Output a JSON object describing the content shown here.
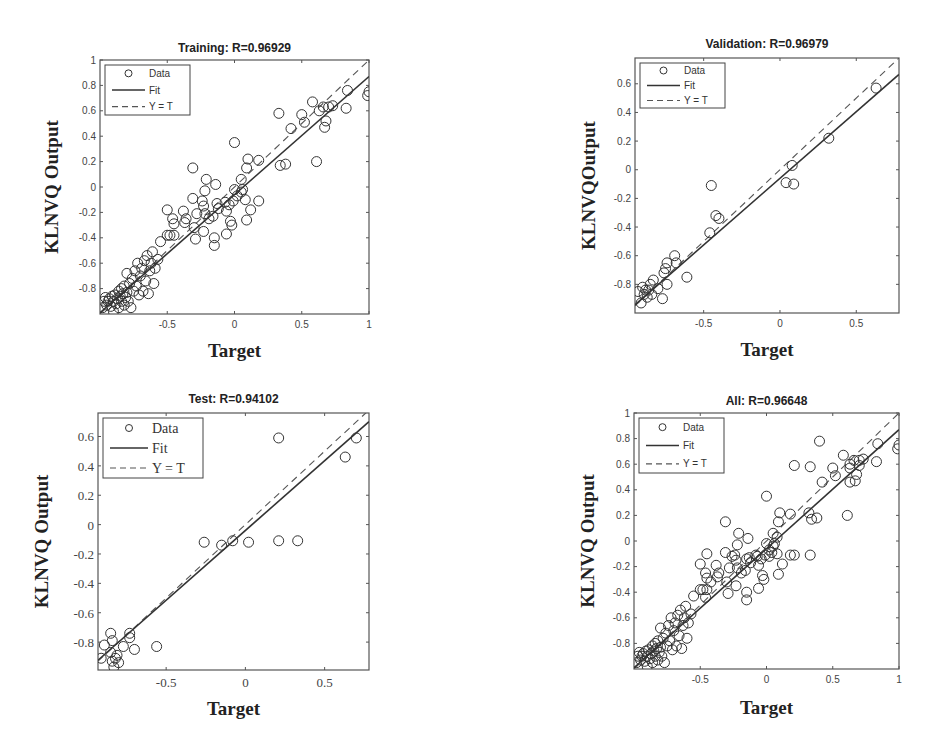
{
  "chart_data": [
    {
      "type": "scatter",
      "id": "training",
      "title": "Training: R=0.96929",
      "xlabel": "Target",
      "ylabel": "KLNVQ Output",
      "xlim": [
        -1,
        1
      ],
      "ylim": [
        -1,
        1
      ],
      "xticks": [
        -0.5,
        0,
        0.5,
        1
      ],
      "xtick_labels": [
        "-0.5",
        "0",
        "0.5",
        "1"
      ],
      "yticks": [
        -0.8,
        -0.6,
        -0.4,
        -0.2,
        0,
        0.2,
        0.4,
        0.6,
        0.8,
        1
      ],
      "ytick_labels": [
        "-0.8",
        "-0.6",
        "-0.4",
        "-0.2",
        "0",
        "0.2",
        "0.4",
        "0.6",
        "0.8",
        "1"
      ],
      "legend": [
        "Data",
        "Fit",
        "Y = T"
      ],
      "legend_position": "upper left",
      "grid": false,
      "fit": {
        "slope": 0.93,
        "intercept": -0.06
      },
      "points": [
        [
          -0.98,
          -0.95
        ],
        [
          -0.97,
          -0.9
        ],
        [
          -0.96,
          -0.87
        ],
        [
          -0.95,
          -0.93
        ],
        [
          -0.94,
          -0.9
        ],
        [
          -0.93,
          -0.88
        ],
        [
          -0.92,
          -0.94
        ],
        [
          -0.91,
          -0.86
        ],
        [
          -0.9,
          -0.9
        ],
        [
          -0.9,
          -0.98
        ],
        [
          -0.89,
          -0.85
        ],
        [
          -0.88,
          -0.92
        ],
        [
          -0.87,
          -0.88
        ],
        [
          -0.86,
          -0.82
        ],
        [
          -0.86,
          -0.95
        ],
        [
          -0.85,
          -0.86
        ],
        [
          -0.84,
          -0.9
        ],
        [
          -0.84,
          -0.8
        ],
        [
          -0.83,
          -0.84
        ],
        [
          -0.82,
          -0.93
        ],
        [
          -0.82,
          -0.78
        ],
        [
          -0.81,
          -0.87
        ],
        [
          -0.8,
          -0.83
        ],
        [
          -0.8,
          -0.68
        ],
        [
          -0.79,
          -0.9
        ],
        [
          -0.78,
          -0.76
        ],
        [
          -0.77,
          -0.95
        ],
        [
          -0.76,
          -0.72
        ],
        [
          -0.75,
          -0.82
        ],
        [
          -0.74,
          -0.66
        ],
        [
          -0.73,
          -0.78
        ],
        [
          -0.72,
          -0.6
        ],
        [
          -0.71,
          -0.85
        ],
        [
          -0.7,
          -0.7
        ],
        [
          -0.69,
          -0.64
        ],
        [
          -0.68,
          -0.82
        ],
        [
          -0.67,
          -0.58
        ],
        [
          -0.66,
          -0.74
        ],
        [
          -0.65,
          -0.54
        ],
        [
          -0.64,
          -0.84
        ],
        [
          -0.63,
          -0.66
        ],
        [
          -0.62,
          -0.6
        ],
        [
          -0.61,
          -0.51
        ],
        [
          -0.6,
          -0.76
        ],
        [
          -0.59,
          -0.64
        ],
        [
          -0.57,
          -0.57
        ],
        [
          -0.55,
          -0.43
        ],
        [
          -0.5,
          -0.18
        ],
        [
          -0.5,
          -0.38
        ],
        [
          -0.48,
          -0.38
        ],
        [
          -0.46,
          -0.25
        ],
        [
          -0.45,
          -0.29
        ],
        [
          -0.45,
          -0.38
        ],
        [
          -0.38,
          -0.19
        ],
        [
          -0.37,
          -0.28
        ],
        [
          -0.36,
          -0.25
        ],
        [
          -0.31,
          0.15
        ],
        [
          -0.31,
          -0.09
        ],
        [
          -0.3,
          -0.32
        ],
        [
          -0.29,
          -0.41
        ],
        [
          -0.28,
          -0.21
        ],
        [
          -0.24,
          -0.11
        ],
        [
          -0.23,
          -0.15
        ],
        [
          -0.23,
          -0.35
        ],
        [
          -0.22,
          -0.03
        ],
        [
          -0.22,
          -0.21
        ],
        [
          -0.21,
          0.06
        ],
        [
          -0.19,
          -0.25
        ],
        [
          -0.16,
          -0.23
        ],
        [
          -0.15,
          -0.4
        ],
        [
          -0.15,
          -0.46
        ],
        [
          -0.14,
          0.02
        ],
        [
          -0.13,
          -0.13
        ],
        [
          -0.12,
          -0.17
        ],
        [
          -0.07,
          -0.12
        ],
        [
          -0.06,
          -0.19
        ],
        [
          -0.06,
          -0.37
        ],
        [
          -0.04,
          -0.14
        ],
        [
          -0.03,
          -0.27
        ],
        [
          -0.02,
          -0.3
        ],
        [
          -0.01,
          -0.11
        ],
        [
          0.0,
          0.35
        ],
        [
          0.0,
          -0.02
        ],
        [
          0.02,
          -0.07
        ],
        [
          0.05,
          0.06
        ],
        [
          0.05,
          -0.04
        ],
        [
          0.06,
          -0.02
        ],
        [
          0.08,
          -0.1
        ],
        [
          0.09,
          0.15
        ],
        [
          0.09,
          -0.26
        ],
        [
          0.1,
          0.22
        ],
        [
          0.12,
          -0.18
        ],
        [
          0.18,
          0.21
        ],
        [
          0.18,
          -0.11
        ],
        [
          0.33,
          0.58
        ],
        [
          0.34,
          0.17
        ],
        [
          0.38,
          0.18
        ],
        [
          0.42,
          0.46
        ],
        [
          0.5,
          0.57
        ],
        [
          0.52,
          0.51
        ],
        [
          0.58,
          0.67
        ],
        [
          0.61,
          0.2
        ],
        [
          0.63,
          0.6
        ],
        [
          0.66,
          0.63
        ],
        [
          0.67,
          0.47
        ],
        [
          0.68,
          0.52
        ],
        [
          0.7,
          0.63
        ],
        [
          0.73,
          0.64
        ],
        [
          0.83,
          0.62
        ],
        [
          0.84,
          0.76
        ],
        [
          0.99,
          0.72
        ],
        [
          1.0,
          0.75
        ]
      ]
    },
    {
      "type": "scatter",
      "id": "validation",
      "title": "Validation: R=0.96979",
      "xlabel": "Target",
      "ylabel": "KLNVQOutput",
      "xlim": [
        -0.95,
        0.78
      ],
      "ylim": [
        -1.0,
        0.78
      ],
      "xticks": [
        -0.5,
        0,
        0.5
      ],
      "xtick_labels": [
        "-0.5",
        "0",
        "0.5"
      ],
      "yticks": [
        -0.8,
        -0.6,
        -0.4,
        -0.2,
        0,
        0.2,
        0.4,
        0.6
      ],
      "ytick_labels": [
        "-0.8",
        "-0.6",
        "-0.4",
        "-0.2",
        "0",
        "0.2",
        "0.4",
        "0.6"
      ],
      "legend": [
        "Data",
        "Fit",
        "Y = T"
      ],
      "legend_position": "upper left",
      "grid": false,
      "fit": {
        "slope": 0.93,
        "intercept": -0.06
      },
      "points": [
        [
          -0.93,
          -0.85
        ],
        [
          -0.91,
          -0.93
        ],
        [
          -0.9,
          -0.82
        ],
        [
          -0.89,
          -0.87
        ],
        [
          -0.88,
          -0.84
        ],
        [
          -0.87,
          -0.89
        ],
        [
          -0.86,
          -0.84
        ],
        [
          -0.85,
          -0.8
        ],
        [
          -0.84,
          -0.87
        ],
        [
          -0.83,
          -0.77
        ],
        [
          -0.8,
          -0.83
        ],
        [
          -0.77,
          -0.9
        ],
        [
          -0.76,
          -0.72
        ],
        [
          -0.75,
          -0.69
        ],
        [
          -0.74,
          -0.65
        ],
        [
          -0.74,
          -0.8
        ],
        [
          -0.69,
          -0.6
        ],
        [
          -0.68,
          -0.65
        ],
        [
          -0.61,
          -0.75
        ],
        [
          -0.46,
          -0.44
        ],
        [
          -0.45,
          -0.11
        ],
        [
          -0.42,
          -0.32
        ],
        [
          -0.4,
          -0.34
        ],
        [
          0.04,
          -0.09
        ],
        [
          0.08,
          0.03
        ],
        [
          0.09,
          -0.1
        ],
        [
          0.32,
          0.22
        ],
        [
          0.63,
          0.57
        ]
      ]
    },
    {
      "type": "scatter",
      "id": "test",
      "title": "Test: R=0.94102",
      "xlabel": "Target",
      "ylabel": "KLNVQ Output",
      "xlim": [
        -0.93,
        0.78
      ],
      "ylim": [
        -0.99,
        0.76
      ],
      "xticks": [
        -0.5,
        0,
        0.5
      ],
      "xtick_labels": [
        "-0.5",
        "0",
        "0.5"
      ],
      "yticks": [
        -0.8,
        -0.6,
        -0.4,
        -0.2,
        0,
        0.2,
        0.4,
        0.6
      ],
      "ytick_labels": [
        "-0.8",
        "-0.6",
        "-0.4",
        "-0.2",
        "0",
        "0.2",
        "0.4",
        "0.6"
      ],
      "legend": [
        "Data",
        "Fit",
        "Y = T"
      ],
      "legend_position": "upper left",
      "grid": false,
      "fit": {
        "slope": 0.95,
        "intercept": -0.04
      },
      "points": [
        [
          -0.91,
          -0.91
        ],
        [
          -0.89,
          -0.82
        ],
        [
          -0.85,
          -0.74
        ],
        [
          -0.85,
          -0.87
        ],
        [
          -0.84,
          -0.93
        ],
        [
          -0.84,
          -0.79
        ],
        [
          -0.83,
          -0.97
        ],
        [
          -0.82,
          -0.91
        ],
        [
          -0.81,
          -0.89
        ],
        [
          -0.8,
          -0.94
        ],
        [
          -0.77,
          -0.83
        ],
        [
          -0.73,
          -0.74
        ],
        [
          -0.73,
          -0.77
        ],
        [
          -0.7,
          -0.85
        ],
        [
          -0.56,
          -0.83
        ],
        [
          -0.26,
          -0.12
        ],
        [
          -0.15,
          -0.14
        ],
        [
          -0.08,
          -0.11
        ],
        [
          0.02,
          -0.12
        ],
        [
          0.21,
          0.59
        ],
        [
          0.21,
          -0.11
        ],
        [
          0.33,
          -0.11
        ],
        [
          0.63,
          0.46
        ],
        [
          0.7,
          0.59
        ]
      ]
    },
    {
      "type": "scatter",
      "id": "all",
      "title": "All: R=0.96648",
      "xlabel": "Target",
      "ylabel": "KLNVQ Output",
      "xlim": [
        -1,
        1
      ],
      "ylim": [
        -1,
        1
      ],
      "xticks": [
        -0.5,
        0,
        0.5,
        1
      ],
      "xtick_labels": [
        "-0.5",
        "0",
        "0.5",
        "1"
      ],
      "yticks": [
        -0.8,
        -0.6,
        -0.4,
        -0.2,
        0,
        0.2,
        0.4,
        0.6,
        0.8,
        1
      ],
      "ytick_labels": [
        "-0.8",
        "-0.6",
        "-0.4",
        "-0.2",
        "0",
        "0.2",
        "0.4",
        "0.6",
        "0.8",
        "1"
      ],
      "legend": [
        "Data",
        "Fit",
        "Y = T"
      ],
      "legend_position": "upper left",
      "grid": false,
      "fit": {
        "slope": 0.93,
        "intercept": -0.06
      },
      "points": [
        [
          -0.98,
          -0.95
        ],
        [
          -0.97,
          -0.9
        ],
        [
          -0.96,
          -0.87
        ],
        [
          -0.95,
          -0.93
        ],
        [
          -0.94,
          -0.9
        ],
        [
          -0.93,
          -0.88
        ],
        [
          -0.92,
          -0.94
        ],
        [
          -0.91,
          -0.86
        ],
        [
          -0.9,
          -0.9
        ],
        [
          -0.9,
          -0.98
        ],
        [
          -0.89,
          -0.85
        ],
        [
          -0.88,
          -0.92
        ],
        [
          -0.87,
          -0.88
        ],
        [
          -0.86,
          -0.82
        ],
        [
          -0.86,
          -0.95
        ],
        [
          -0.85,
          -0.86
        ],
        [
          -0.84,
          -0.9
        ],
        [
          -0.84,
          -0.8
        ],
        [
          -0.83,
          -0.84
        ],
        [
          -0.82,
          -0.93
        ],
        [
          -0.82,
          -0.78
        ],
        [
          -0.81,
          -0.87
        ],
        [
          -0.8,
          -0.83
        ],
        [
          -0.8,
          -0.68
        ],
        [
          -0.79,
          -0.9
        ],
        [
          -0.78,
          -0.76
        ],
        [
          -0.77,
          -0.95
        ],
        [
          -0.76,
          -0.72
        ],
        [
          -0.75,
          -0.82
        ],
        [
          -0.74,
          -0.66
        ],
        [
          -0.73,
          -0.78
        ],
        [
          -0.72,
          -0.6
        ],
        [
          -0.71,
          -0.85
        ],
        [
          -0.7,
          -0.7
        ],
        [
          -0.69,
          -0.64
        ],
        [
          -0.68,
          -0.82
        ],
        [
          -0.67,
          -0.58
        ],
        [
          -0.66,
          -0.74
        ],
        [
          -0.65,
          -0.54
        ],
        [
          -0.64,
          -0.84
        ],
        [
          -0.63,
          -0.66
        ],
        [
          -0.62,
          -0.6
        ],
        [
          -0.61,
          -0.51
        ],
        [
          -0.6,
          -0.76
        ],
        [
          -0.59,
          -0.64
        ],
        [
          -0.57,
          -0.57
        ],
        [
          -0.55,
          -0.43
        ],
        [
          -0.5,
          -0.18
        ],
        [
          -0.5,
          -0.38
        ],
        [
          -0.48,
          -0.38
        ],
        [
          -0.46,
          -0.25
        ],
        [
          -0.45,
          -0.29
        ],
        [
          -0.45,
          -0.38
        ],
        [
          -0.45,
          -0.1
        ],
        [
          -0.46,
          -0.44
        ],
        [
          -0.42,
          -0.32
        ],
        [
          -0.38,
          -0.19
        ],
        [
          -0.37,
          -0.28
        ],
        [
          -0.36,
          -0.25
        ],
        [
          -0.31,
          0.15
        ],
        [
          -0.31,
          -0.09
        ],
        [
          -0.3,
          -0.32
        ],
        [
          -0.29,
          -0.41
        ],
        [
          -0.28,
          -0.21
        ],
        [
          -0.26,
          -0.12
        ],
        [
          -0.24,
          -0.11
        ],
        [
          -0.23,
          -0.15
        ],
        [
          -0.23,
          -0.35
        ],
        [
          -0.22,
          -0.03
        ],
        [
          -0.22,
          -0.21
        ],
        [
          -0.21,
          0.06
        ],
        [
          -0.19,
          -0.25
        ],
        [
          -0.16,
          -0.23
        ],
        [
          -0.15,
          -0.14
        ],
        [
          -0.15,
          -0.4
        ],
        [
          -0.15,
          -0.46
        ],
        [
          -0.14,
          0.02
        ],
        [
          -0.13,
          -0.13
        ],
        [
          -0.12,
          -0.17
        ],
        [
          -0.08,
          -0.11
        ],
        [
          -0.07,
          -0.12
        ],
        [
          -0.06,
          -0.19
        ],
        [
          -0.06,
          -0.37
        ],
        [
          -0.04,
          -0.14
        ],
        [
          -0.03,
          -0.27
        ],
        [
          -0.02,
          -0.3
        ],
        [
          -0.01,
          -0.11
        ],
        [
          0.0,
          0.35
        ],
        [
          0.0,
          -0.02
        ],
        [
          0.02,
          -0.07
        ],
        [
          0.02,
          -0.12
        ],
        [
          0.04,
          -0.09
        ],
        [
          0.05,
          0.06
        ],
        [
          0.05,
          -0.04
        ],
        [
          0.06,
          -0.02
        ],
        [
          0.08,
          0.03
        ],
        [
          0.08,
          -0.1
        ],
        [
          0.09,
          0.15
        ],
        [
          0.09,
          -0.26
        ],
        [
          0.1,
          0.22
        ],
        [
          0.12,
          -0.18
        ],
        [
          0.18,
          0.21
        ],
        [
          0.18,
          -0.11
        ],
        [
          0.21,
          0.59
        ],
        [
          0.21,
          -0.11
        ],
        [
          0.32,
          0.22
        ],
        [
          0.33,
          0.58
        ],
        [
          0.33,
          -0.11
        ],
        [
          0.34,
          0.17
        ],
        [
          0.38,
          0.18
        ],
        [
          0.4,
          0.78
        ],
        [
          0.42,
          0.46
        ],
        [
          0.5,
          0.57
        ],
        [
          0.52,
          0.51
        ],
        [
          0.58,
          0.67
        ],
        [
          0.61,
          0.2
        ],
        [
          0.63,
          0.6
        ],
        [
          0.63,
          0.46
        ],
        [
          0.63,
          0.57
        ],
        [
          0.66,
          0.63
        ],
        [
          0.67,
          0.47
        ],
        [
          0.68,
          0.52
        ],
        [
          0.7,
          0.63
        ],
        [
          0.7,
          0.59
        ],
        [
          0.73,
          0.64
        ],
        [
          0.83,
          0.62
        ],
        [
          0.84,
          0.76
        ],
        [
          0.99,
          0.72
        ],
        [
          1.0,
          0.75
        ]
      ]
    }
  ]
}
